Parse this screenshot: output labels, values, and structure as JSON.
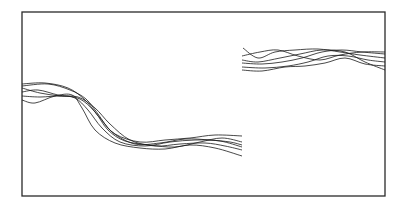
{
  "chart_data": {
    "type": "line",
    "title": "",
    "xlabel": "",
    "ylabel": "",
    "grid": false,
    "legend": "none",
    "frame": {
      "x": 22,
      "y": 12,
      "width": 363,
      "height": 184
    },
    "colors": {
      "line": "#1a1a1a",
      "frame": "#2a2a2a",
      "background": "#ffffff"
    },
    "segments": [
      {
        "name": "left-segment",
        "x_range_px": [
          22,
          242
        ],
        "description": "Bundle of traces starting high at left, descending around x=70-130, then oscillating low",
        "series": [
          {
            "name": "trace-1",
            "points": [
              [
                22,
                84
              ],
              [
                45,
                83
              ],
              [
                68,
                88
              ],
              [
                85,
                100
              ],
              [
                100,
                118
              ],
              [
                115,
                134
              ],
              [
                140,
                142
              ],
              [
                165,
                140
              ],
              [
                190,
                138
              ],
              [
                215,
                135
              ],
              [
                242,
                136
              ]
            ]
          },
          {
            "name": "trace-2",
            "points": [
              [
                22,
                88
              ],
              [
                40,
                93
              ],
              [
                60,
                96
              ],
              [
                78,
                97
              ],
              [
                95,
                108
              ],
              [
                110,
                124
              ],
              [
                130,
                140
              ],
              [
                155,
                146
              ],
              [
                180,
                144
              ],
              [
                205,
                143
              ],
              [
                225,
                146
              ],
              [
                242,
                150
              ]
            ]
          },
          {
            "name": "trace-3",
            "points": [
              [
                22,
                92
              ],
              [
                38,
                90
              ],
              [
                58,
                95
              ],
              [
                75,
                98
              ],
              [
                88,
                110
              ],
              [
                102,
                128
              ],
              [
                120,
                142
              ],
              [
                145,
                146
              ],
              [
                170,
                142
              ],
              [
                195,
                140
              ],
              [
                220,
                141
              ],
              [
                242,
                147
              ]
            ]
          },
          {
            "name": "trace-4",
            "points": [
              [
                22,
                96
              ],
              [
                40,
                97
              ],
              [
                62,
                96
              ],
              [
                80,
                99
              ],
              [
                95,
                112
              ],
              [
                108,
                130
              ],
              [
                125,
                141
              ],
              [
                150,
                145
              ],
              [
                175,
                147
              ],
              [
                200,
                142
              ],
              [
                222,
                138
              ],
              [
                242,
                142
              ]
            ]
          },
          {
            "name": "trace-5",
            "points": [
              [
                22,
                100
              ],
              [
                35,
                103
              ],
              [
                55,
                96
              ],
              [
                72,
                95
              ],
              [
                82,
                108
              ],
              [
                95,
                130
              ],
              [
                115,
                143
              ],
              [
                140,
                148
              ],
              [
                165,
                149
              ],
              [
                190,
                145
              ],
              [
                215,
                148
              ],
              [
                242,
                156
              ]
            ]
          },
          {
            "name": "trace-6",
            "points": [
              [
                22,
                86
              ],
              [
                48,
                84
              ],
              [
                70,
                90
              ],
              [
                86,
                99
              ],
              [
                98,
                114
              ],
              [
                112,
                132
              ],
              [
                135,
                144
              ],
              [
                160,
                143
              ],
              [
                185,
                139
              ],
              [
                210,
                140
              ],
              [
                230,
                142
              ],
              [
                242,
                145
              ]
            ]
          }
        ]
      },
      {
        "name": "right-segment",
        "x_range_px": [
          242,
          385
        ],
        "description": "Bundle of traces at upper level oscillating near y=48-70",
        "series": [
          {
            "name": "trace-1",
            "points": [
              [
                243,
                48
              ],
              [
                258,
                58
              ],
              [
                275,
                52
              ],
              [
                295,
                50
              ],
              [
                318,
                49
              ],
              [
                340,
                52
              ],
              [
                360,
                55
              ],
              [
                385,
                58
              ]
            ]
          },
          {
            "name": "trace-2",
            "points": [
              [
                242,
                56
              ],
              [
                260,
                52
              ],
              [
                278,
                50
              ],
              [
                298,
                56
              ],
              [
                320,
                60
              ],
              [
                340,
                55
              ],
              [
                362,
                52
              ],
              [
                385,
                52
              ]
            ]
          },
          {
            "name": "trace-3",
            "points": [
              [
                242,
                60
              ],
              [
                258,
                62
              ],
              [
                280,
                58
              ],
              [
                300,
                54
              ],
              [
                322,
                50
              ],
              [
                345,
                52
              ],
              [
                365,
                62
              ],
              [
                385,
                70
              ]
            ]
          },
          {
            "name": "trace-4",
            "points": [
              [
                242,
                63
              ],
              [
                262,
                64
              ],
              [
                282,
                62
              ],
              [
                302,
                58
              ],
              [
                322,
                52
              ],
              [
                342,
                50
              ],
              [
                362,
                52
              ],
              [
                385,
                54
              ]
            ]
          },
          {
            "name": "trace-5",
            "points": [
              [
                242,
                67
              ],
              [
                265,
                68
              ],
              [
                288,
                66
              ],
              [
                308,
                62
              ],
              [
                328,
                56
              ],
              [
                348,
                56
              ],
              [
                368,
                60
              ],
              [
                385,
                62
              ]
            ]
          },
          {
            "name": "trace-6",
            "points": [
              [
                242,
                70
              ],
              [
                262,
                71
              ],
              [
                285,
                67
              ],
              [
                305,
                66
              ],
              [
                325,
                63
              ],
              [
                345,
                58
              ],
              [
                365,
                64
              ],
              [
                385,
                66
              ]
            ]
          }
        ]
      }
    ]
  }
}
